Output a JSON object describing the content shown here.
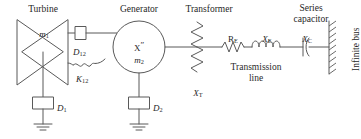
{
  "diagram": {
    "type": "power-system-one-line-diagram",
    "colors": {
      "line": "#595959",
      "text": "#1f1f1f",
      "background": "#ffffff"
    },
    "headings": {
      "turbine": "Turbine",
      "generator": "Generator",
      "transformer": "Transformer",
      "series_capacitor_line1": "Series",
      "series_capacitor_line2": "capacitor"
    },
    "labels": {
      "turbine_mass": "m",
      "turbine_mass_sub": "1",
      "generator_reactance": "X",
      "generator_reactance_prime": "″",
      "generator_mass": "m",
      "generator_mass_sub": "2",
      "shaft_damping": "D",
      "shaft_damping_sub": "12",
      "shaft_stiffness": "K",
      "shaft_stiffness_sub": "12",
      "damper_one": "D",
      "damper_one_sub": "1",
      "damper_two": "D",
      "damper_two_sub": "2",
      "transformer_reactance": "X",
      "transformer_reactance_sub": "T",
      "line_resistance": "R",
      "line_resistance_sub": "E",
      "line_reactance": "X",
      "line_reactance_sub": "E",
      "capacitor_reactance": "X",
      "capacitor_reactance_sub": "C",
      "transmission_line_line1": "Transmission",
      "transmission_line_line2": "line",
      "infinite_bus": "Infinite bus"
    },
    "components": [
      {
        "name": "turbine",
        "symbol": "bowtie",
        "label": "m1"
      },
      {
        "name": "damper-D1",
        "symbol": "box-to-ground",
        "label": "D1"
      },
      {
        "name": "shaft-damper-D12",
        "symbol": "box",
        "label": "D12"
      },
      {
        "name": "shaft-spring-K12",
        "symbol": "coil-spring",
        "label": "K12"
      },
      {
        "name": "generator",
        "symbol": "circle",
        "label": "X″ m2"
      },
      {
        "name": "damper-D2",
        "symbol": "box-to-ground",
        "label": "D2"
      },
      {
        "name": "transformer",
        "symbol": "vertical-zigzag-reactance",
        "label": "XT"
      },
      {
        "name": "line-resistance",
        "symbol": "resistor-zigzag",
        "label": "RE"
      },
      {
        "name": "line-reactance",
        "symbol": "inductor-coils",
        "label": "XE"
      },
      {
        "name": "series-capacitor",
        "symbol": "capacitor-curved-plate",
        "label": "XC"
      },
      {
        "name": "infinite-bus",
        "symbol": "hatched-bar",
        "label": "Infinite bus"
      }
    ]
  }
}
